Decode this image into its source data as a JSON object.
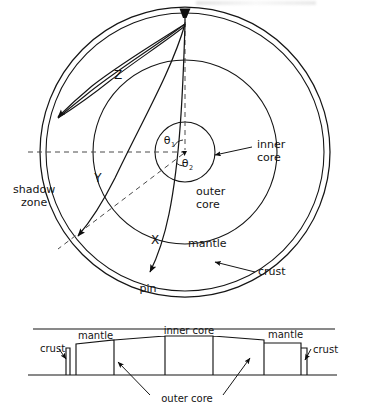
{
  "figure": {
    "upper_panel": {
      "name": "earth-cross-section",
      "layers": [
        {
          "key": "crust",
          "label": "crust"
        },
        {
          "key": "mantle",
          "label": "mantle"
        },
        {
          "key": "outer_core",
          "label": "outer core"
        },
        {
          "key": "inner_core",
          "label": "inner core"
        }
      ],
      "labels": {
        "inner_core_line1": "inner",
        "inner_core_line2": "core",
        "outer_core_line1": "outer",
        "outer_core_line2": "core",
        "mantle": "mantle",
        "crust": "crust",
        "shadow_line1": "shadow",
        "shadow_line2": "zone",
        "pin": "pin"
      },
      "rays": [
        {
          "name": "ray-x",
          "label": "X"
        },
        {
          "name": "ray-y",
          "label": "Y"
        },
        {
          "name": "ray-z",
          "label": "Z"
        }
      ],
      "angles": [
        {
          "name": "theta-1",
          "symbol": "θ",
          "subscript": "1"
        },
        {
          "name": "theta-2",
          "symbol": "θ",
          "subscript": "2"
        }
      ]
    },
    "lower_panel": {
      "name": "unrolled-profile",
      "labels": {
        "crust_left": "crust",
        "mantle_left": "mantle",
        "inner_core": "inner core",
        "mantle_right": "mantle",
        "crust_right": "crust",
        "outer_core": "outer core"
      }
    }
  },
  "colors": {
    "ink": "#151515",
    "dashed": "#4a4a4a",
    "background": "#ffffff"
  }
}
